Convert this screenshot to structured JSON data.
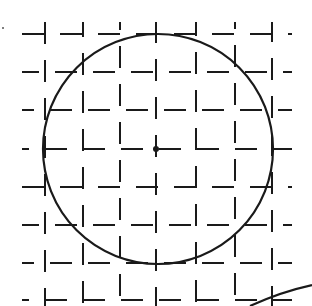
{
  "diagram": {
    "stroke_color": "#1a1a1a",
    "background": "#ffffff",
    "grid": {
      "columns_x": [
        45,
        83,
        120,
        156,
        196,
        235,
        272
      ],
      "rows_y": [
        34,
        72,
        110,
        149,
        187,
        225,
        263,
        300
      ],
      "extent_x": [
        22,
        292
      ],
      "extent_y": [
        22,
        306
      ],
      "dash": "22 16",
      "style": "dashed"
    },
    "circle": {
      "cx": 158,
      "cy": 149,
      "r": 115,
      "stroke_width": 2.2
    },
    "center_point": {
      "x": 156,
      "y": 149,
      "r": 3
    },
    "stray_dot": {
      "x": 3,
      "y": 28,
      "r": 1
    },
    "corner_stroke": {
      "from": [
        250,
        306
      ],
      "to": [
        312,
        285
      ]
    }
  }
}
